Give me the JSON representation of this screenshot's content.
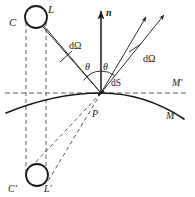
{
  "figure": {
    "colors": {
      "stroke": "#1a1a1a",
      "dashed": "#555555",
      "background": "#ffffff",
      "label": "#1a1a1a"
    },
    "labels": {
      "source_center": "C",
      "source_point": "L",
      "image_center": "C'",
      "image_point": "L'",
      "normal": "n",
      "solid_angle_in": "dΩ",
      "solid_angle_out": "dΩ",
      "theta_in": "θ",
      "theta_out": "θ",
      "surface_element": "dS",
      "surface_point": "P",
      "tangent_line": "M'",
      "surface_curve": "M"
    },
    "geometry": {
      "point_P": {
        "x": 101,
        "y": 93
      },
      "normal_tip": {
        "x": 101,
        "y": 8
      },
      "source_circle": {
        "cx": 36,
        "cy": 17,
        "r": 11
      },
      "image_circle": {
        "cx": 37,
        "cy": 175,
        "r": 11
      },
      "tangent_line_y": 93,
      "vertical_dash_x": [
        26,
        45
      ],
      "ray_out_1_tip": {
        "x": 148,
        "y": 14
      },
      "ray_out_2_tip": {
        "x": 166,
        "y": 12
      },
      "angle_arc_radius": 22
    }
  }
}
